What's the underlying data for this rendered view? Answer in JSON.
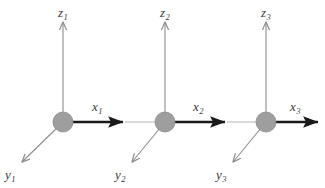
{
  "figure": {
    "type": "diagram",
    "background_color": "#ffffff",
    "width": 325,
    "height": 188
  },
  "style": {
    "node_fill": "#9e9e9e",
    "node_stroke": "#8a8a8a",
    "x_axis_color": "#1a1a1a",
    "z_axis_color": "#8d8d8d",
    "y_axis_color": "#8d8d8d",
    "connector_color": "#b4b4b4",
    "label_color": "#3a3a3a"
  },
  "frames": [
    {
      "id": "frame-1",
      "origin": {
        "x": 63,
        "y": 122,
        "radius": 10
      },
      "x_axis": {
        "label": "x",
        "subscript": "1",
        "label_x": 92,
        "label_y": 100,
        "from_x": 63,
        "from_y": 122,
        "to_x": 125,
        "to_y": 122
      },
      "z_axis": {
        "label": "z",
        "subscript": "1",
        "label_x": 58,
        "label_y": 6,
        "from_x": 63,
        "from_y": 122,
        "to_x": 63,
        "to_y": 20
      },
      "y_axis": {
        "label": "y",
        "subscript": "1",
        "label_x": 5,
        "label_y": 168,
        "from_x": 63,
        "from_y": 122,
        "to_x": 21,
        "to_y": 163
      }
    },
    {
      "id": "frame-2",
      "origin": {
        "x": 165,
        "y": 122,
        "radius": 10
      },
      "x_axis": {
        "label": "x",
        "subscript": "2",
        "label_x": 193,
        "label_y": 100,
        "from_x": 165,
        "from_y": 122,
        "to_x": 227,
        "to_y": 122
      },
      "z_axis": {
        "label": "z",
        "subscript": "2",
        "label_x": 160,
        "label_y": 6,
        "from_x": 165,
        "from_y": 122,
        "to_x": 165,
        "to_y": 20
      },
      "y_axis": {
        "label": "y",
        "subscript": "2",
        "label_x": 115,
        "label_y": 168,
        "from_x": 165,
        "from_y": 122,
        "to_x": 131,
        "to_y": 163
      }
    },
    {
      "id": "frame-3",
      "origin": {
        "x": 266,
        "y": 122,
        "radius": 10
      },
      "x_axis": {
        "label": "x",
        "subscript": "3",
        "label_x": 290,
        "label_y": 100,
        "from_x": 266,
        "from_y": 122,
        "to_x": 320,
        "to_y": 122
      },
      "z_axis": {
        "label": "z",
        "subscript": "3",
        "label_x": 261,
        "label_y": 6,
        "from_x": 266,
        "from_y": 122,
        "to_x": 266,
        "to_y": 20
      },
      "y_axis": {
        "label": "y",
        "subscript": "3",
        "label_x": 216,
        "label_y": 168,
        "from_x": 266,
        "from_y": 122,
        "to_x": 232,
        "to_y": 163
      }
    }
  ],
  "connectors": [
    {
      "id": "link-1-2",
      "from_x": 125,
      "from_y": 122,
      "to_x": 165,
      "to_y": 122
    },
    {
      "id": "link-2-3",
      "from_x": 227,
      "from_y": 122,
      "to_x": 266,
      "to_y": 122
    }
  ]
}
